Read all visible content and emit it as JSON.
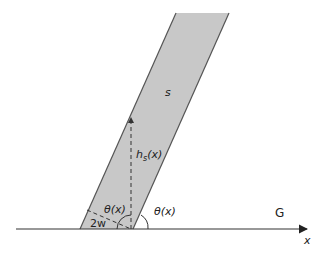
{
  "diagram": {
    "type": "geometry-schematic",
    "labels": {
      "strip": "s",
      "ground": "G",
      "axis": "x",
      "height": "h",
      "height_sub": "s",
      "height_arg": "(x)",
      "width": "2w",
      "angle_inner": "θ(x)",
      "angle_outer": "θ(x)"
    },
    "colors": {
      "strip_fill": "#c8c8c8",
      "strip_edge": "#555555",
      "lines": "#333333",
      "background": "#ffffff"
    }
  }
}
